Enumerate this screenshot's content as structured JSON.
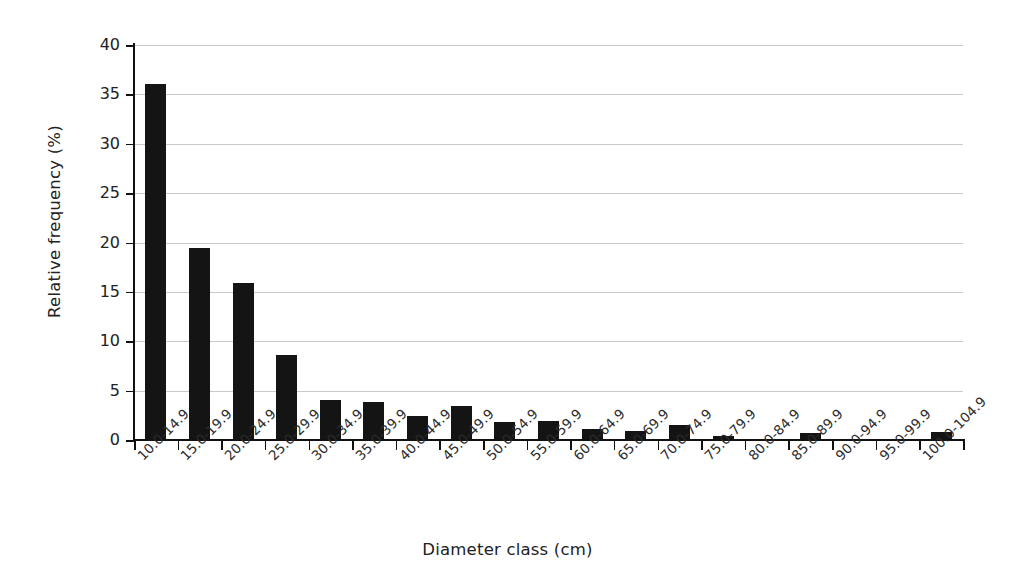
{
  "chart_data": {
    "type": "bar",
    "title": "",
    "xlabel": "Diameter class (cm)",
    "ylabel": "Relative frequency (%)",
    "ylim": [
      0,
      40
    ],
    "ytick_step": 5,
    "yticks": [
      0,
      5,
      10,
      15,
      20,
      25,
      30,
      35,
      40
    ],
    "grid": true,
    "grid_axis": "y",
    "legend": false,
    "legend_position": "none",
    "bar_color": "#141414",
    "categories": [
      "10.0-14.9",
      "15.0-19.9",
      "20.0-24.9",
      "25.0-29.9",
      "30.0-34.9",
      "35.0-39.9",
      "40.0-44.9",
      "45.0-49.9",
      "50.0-54.9",
      "55.0-59.9",
      "60.0-64.9",
      "65.0-69.9",
      "70.0-74.9",
      "75.0-79.9",
      "80.0-84.9",
      "85.0-89.9",
      "90.0-94.9",
      "95.0-99.9",
      "100.0-104.9"
    ],
    "values": [
      36.1,
      19.4,
      15.9,
      8.6,
      4.1,
      3.9,
      2.4,
      3.4,
      1.8,
      1.9,
      1.1,
      0.9,
      1.5,
      0.4,
      0.0,
      0.7,
      0.0,
      0.0,
      0.8
    ]
  },
  "figure": {
    "background_color": "#ffffff",
    "axis_color": "#111111",
    "grid_color": "#c9c9c9",
    "tick_label_color": "#222222"
  }
}
